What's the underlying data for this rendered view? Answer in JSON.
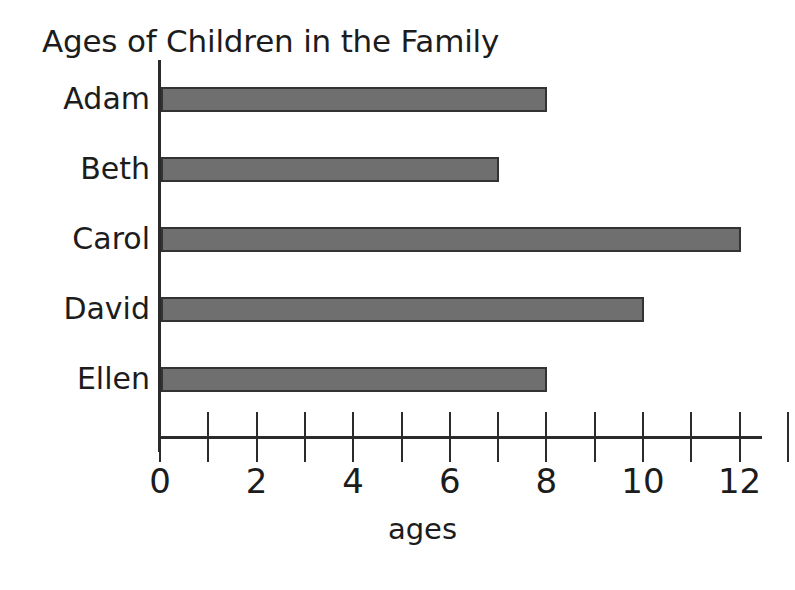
{
  "chart_data": {
    "type": "bar",
    "orientation": "horizontal",
    "title": "Ages of Children in the Family",
    "categories": [
      "Adam",
      "Beth",
      "Carol",
      "David",
      "Ellen"
    ],
    "values": [
      8,
      7,
      12,
      10,
      8
    ],
    "xlabel": "ages",
    "ylabel": "",
    "xlim": [
      0,
      13
    ],
    "tick_values": [
      0,
      1,
      2,
      3,
      4,
      5,
      6,
      7,
      8,
      9,
      10,
      11,
      12,
      13
    ],
    "tick_labels": [
      "0",
      "",
      "2",
      "",
      "4",
      "",
      "6",
      "",
      "8",
      "",
      "10",
      "",
      "12",
      ""
    ],
    "grid": false,
    "legend": false,
    "bar_fill_color": "#6f6f6f",
    "bar_border_color": "#333333",
    "axis_color": "#2b2b2b",
    "background_color": "#ffffff",
    "text_color": "#1c1c1c"
  }
}
